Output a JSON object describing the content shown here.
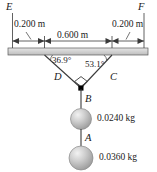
{
  "figure": {
    "background_color": "#ffffff",
    "line_color": "#3a3a3a",
    "ceiling_fill": "#d8d8d8",
    "sphere_color": "#b9b9b9",
    "node_color": "#000000"
  },
  "ceiling": {
    "left_point_label": "E",
    "right_point_label": "F"
  },
  "dimensions": [
    {
      "name": "left-segment",
      "label": "0.200 m"
    },
    {
      "name": "middle-segment",
      "label": "0.600 m"
    },
    {
      "name": "right-segment",
      "label": "0.200 m"
    }
  ],
  "angles": [
    {
      "name": "left-angle",
      "label": "36.9°"
    },
    {
      "name": "right-angle",
      "label": "53.1°"
    }
  ],
  "cords": [
    {
      "name": "cord-D",
      "label": "D"
    },
    {
      "name": "cord-C",
      "label": "C"
    },
    {
      "name": "cord-B",
      "label": "B"
    },
    {
      "name": "cord-A",
      "label": "A"
    }
  ],
  "masses": [
    {
      "name": "upper-mass",
      "label": "0.0240 kg"
    },
    {
      "name": "lower-mass",
      "label": "0.0360 kg"
    }
  ],
  "markers": {
    "right_angle_marker": "right-angle-square",
    "junction_node": "junction-dot"
  }
}
